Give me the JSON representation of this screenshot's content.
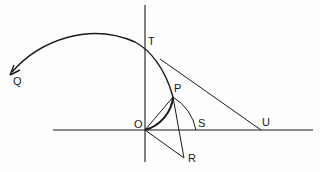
{
  "figure": {
    "colors": {
      "background": "#fdfdfd",
      "stroke": "#1a1a1a"
    },
    "points": {
      "Q": {
        "label": "Q",
        "x": 10,
        "y": 75
      },
      "T": {
        "label": "T",
        "x": 145,
        "y": 52
      },
      "P": {
        "label": "P",
        "x": 173,
        "y": 97
      },
      "O": {
        "label": "O",
        "x": 145,
        "y": 130
      },
      "S": {
        "label": "S",
        "x": 196,
        "y": 130
      },
      "U": {
        "label": "U",
        "x": 261,
        "y": 130
      },
      "R": {
        "label": "R",
        "x": 184,
        "y": 158
      }
    },
    "labels": {
      "Q": "Q",
      "T": "T",
      "P": "P",
      "O": "O",
      "S": "S",
      "U": "U",
      "R": "R"
    },
    "axes": {
      "vertical": {
        "x": 145,
        "y1": 5,
        "y2": 162
      },
      "horizontal": {
        "y": 130,
        "x1": 53,
        "x2": 313
      }
    },
    "segments": [
      {
        "name": "OP",
        "from": "O",
        "to": "P"
      },
      {
        "name": "PR",
        "from": "P",
        "to": "R"
      },
      {
        "name": "OR",
        "from": "O",
        "to": "R"
      },
      {
        "name": "tangent-TU",
        "from": "T",
        "to": "U"
      }
    ],
    "curves": [
      {
        "name": "main-curve",
        "from": "O",
        "through": [
          "P",
          "T"
        ],
        "to": "Q",
        "arrowhead_at": "Q"
      },
      {
        "name": "arc-PS",
        "from": "P",
        "to": "S",
        "center": "O"
      }
    ]
  }
}
